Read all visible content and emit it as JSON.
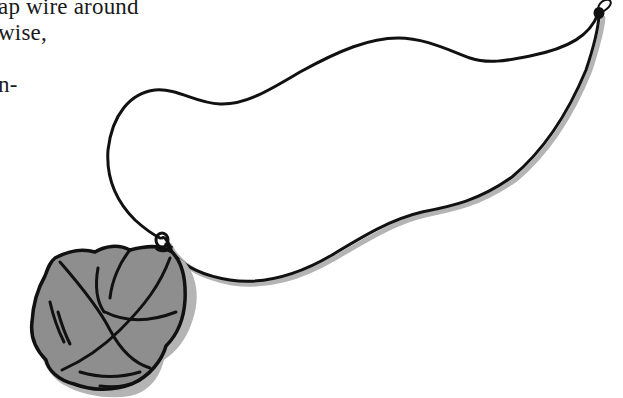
{
  "page": {
    "text_lines": [
      "ap wire around",
      "wise,",
      "n-"
    ]
  },
  "illustration": {
    "subject": "wire-wrapped stone pendant on a cord necklace",
    "colors": {
      "background": "#ffffff",
      "line": "#111111",
      "stone_fill": "#8e8e8e",
      "shadow": "#b4b4b4"
    }
  }
}
